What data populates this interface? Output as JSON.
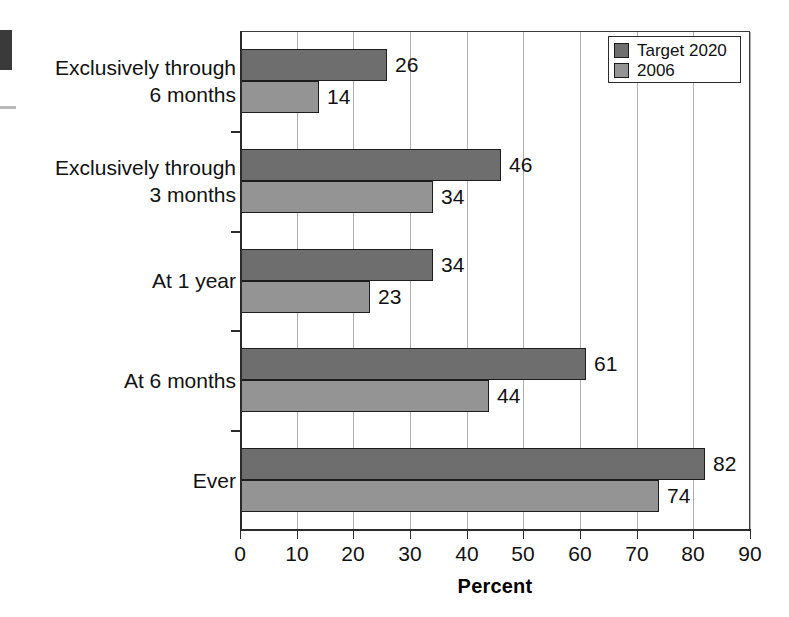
{
  "chart_data": {
    "type": "bar",
    "orientation": "horizontal",
    "title": "",
    "xlabel": "Percent",
    "ylabel": "",
    "xlim": [
      0,
      90
    ],
    "xticks": [
      0,
      10,
      20,
      30,
      40,
      50,
      60,
      70,
      80,
      90
    ],
    "xtick_labels": [
      "0",
      "10",
      "20",
      "30",
      "40",
      "50",
      "60",
      "70",
      "80",
      "90"
    ],
    "grid": "vertical",
    "legend_position": "top-right",
    "categories": [
      "Exclusively through\n6 months",
      "Exclusively through\n3 months",
      "At 1 year",
      "At 6 months",
      "Ever"
    ],
    "series": [
      {
        "name": "Target 2020",
        "color": "#6e6e6e",
        "values": [
          26,
          46,
          34,
          61,
          82
        ],
        "value_labels": [
          "26",
          "46",
          "34",
          "61",
          "82"
        ]
      },
      {
        "name": "2006",
        "color": "#949494",
        "values": [
          14,
          34,
          23,
          44,
          74
        ],
        "value_labels": [
          "14",
          "34",
          "23",
          "44",
          "74"
        ]
      }
    ]
  },
  "legend": {
    "entries": [
      {
        "label": "Target 2020",
        "color": "#6e6e6e"
      },
      {
        "label": "2006",
        "color": "#949494"
      }
    ]
  },
  "colors": {
    "series_target_2020": "#6e6e6e",
    "series_2006": "#949494",
    "axis": "#2b2b2b",
    "gridline": "#aeaeae",
    "background": "#ffffff",
    "text": "#111111"
  }
}
